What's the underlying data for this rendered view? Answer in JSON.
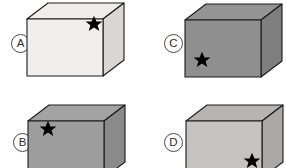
{
  "figure": {
    "type": "spatial-reasoning-multiple-choice",
    "background_color": "#ffffff",
    "outline_color": "#1a1a1a",
    "star_color": "#000000",
    "label_text_color": "#2b2b2b",
    "label_ring_color": "#4a4a4a"
  },
  "options": [
    {
      "id": "A",
      "label": "A",
      "label_x": 11,
      "label_y": 34,
      "box_x": 27,
      "box_y": 2,
      "colors": {
        "front": "#f0efee",
        "top": "#efeeed",
        "side": "#d8d7d5"
      },
      "star": {
        "position_name": "front-face-upper-right",
        "x": 67,
        "y": 22,
        "size": 11.5
      }
    },
    {
      "id": "B",
      "label": "B",
      "label_x": 13,
      "label_y": 133,
      "box_x": 28,
      "box_y": 20,
      "colors": {
        "front": "#9d9d9d",
        "top": "#a3a3a3",
        "side": "#8a8a8a"
      },
      "star": {
        "position_name": "front-face-upper-left",
        "x": 20,
        "y": 25,
        "size": 11.5
      }
    },
    {
      "id": "C",
      "label": "C",
      "label_x": 164,
      "label_y": 34,
      "box_x": 185,
      "box_y": 3,
      "colors": {
        "front": "#8f8f8f",
        "top": "#949494",
        "side": "#7e7e7e"
      },
      "star": {
        "position_name": "front-face-lower-left",
        "x": 17,
        "y": 57,
        "size": 11.5
      }
    },
    {
      "id": "D",
      "label": "D",
      "label_x": 164,
      "label_y": 133,
      "box_x": 186,
      "box_y": 20,
      "colors": {
        "front": "#c4c3c2",
        "top": "#b6b5b4",
        "side": "#a9a8a7"
      },
      "star": {
        "position_name": "front-face-lower-right",
        "x": 66,
        "y": 57,
        "size": 11.5
      }
    }
  ],
  "geometry": {
    "front_face": "M 0 17 L 0 74 L 76 74 L 76 17 Z",
    "top_face": "M 0 17 L 21 1 L 97 1 L 76 17 Z",
    "side_face": "M 76 17 L 97 1 L 97 58 L 76 74 Z"
  }
}
